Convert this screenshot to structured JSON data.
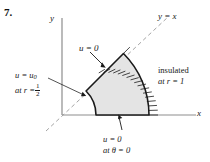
{
  "problem": {
    "number": "7."
  },
  "axes": {
    "y_label": "y",
    "x_label": "x"
  },
  "diagram": {
    "type": "annular-sector-boundary-value-problem",
    "diagonal_label": "y = x",
    "region_fill": "#e4e4e4",
    "stroke_color": "#1a1a1a",
    "axis_color": "#8d8d8d",
    "dashed_color": "#9a9a9a",
    "geometry": {
      "origin_x": 62,
      "origin_y": 115,
      "inner_radius_px": 34,
      "outer_radius_px": 87,
      "theta_start_deg": 0,
      "theta_end_deg": 45,
      "inner_radius_value": "1/2",
      "outer_radius_value": "1"
    },
    "labels": {
      "inner_line1_lhs": "u = u",
      "inner_line1_sub": "0",
      "inner_line2_lhs": "at r =",
      "inner_line2_frac_num": "1",
      "inner_line2_frac_den": "2",
      "outer_line1": "insulated",
      "outer_line2": "at r = 1",
      "bottom_line1": "u = 0",
      "bottom_line2_lhs": "at ",
      "bottom_line2_theta": "θ",
      "bottom_line2_rhs": " = 0",
      "top_edge": "u = 0"
    }
  }
}
